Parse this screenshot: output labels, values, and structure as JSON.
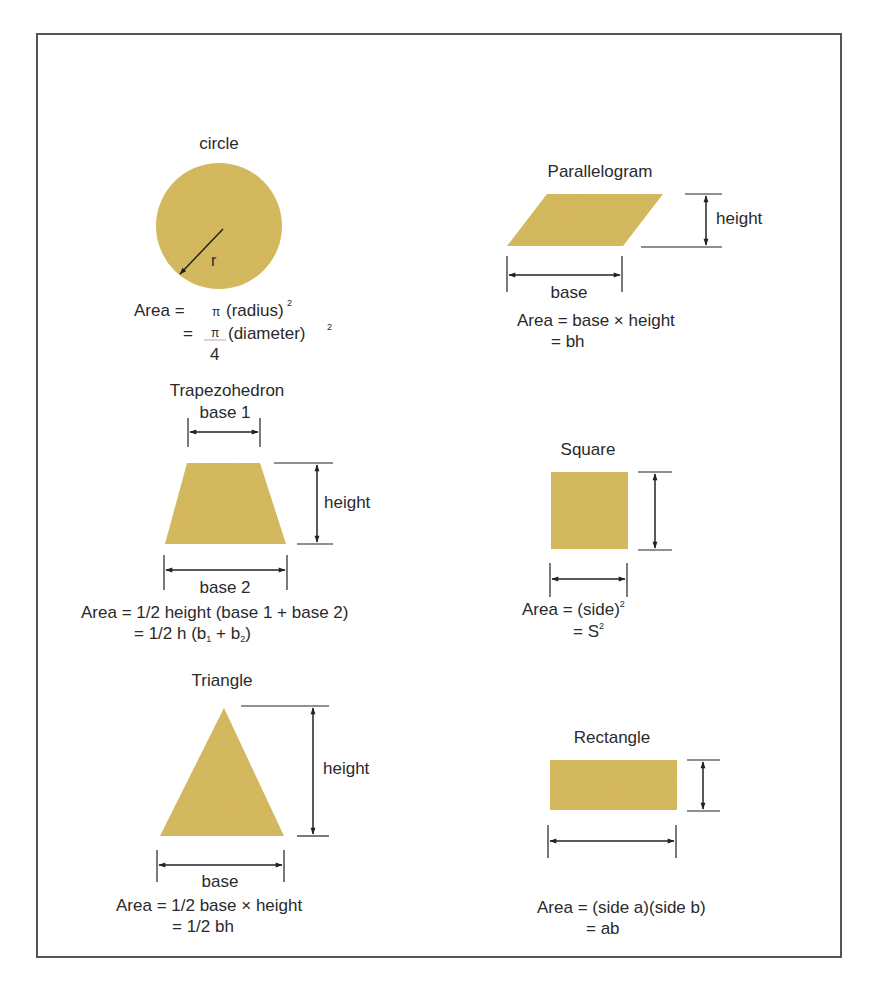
{
  "colors": {
    "shape_fill": "#d9bd62",
    "frame": "#555555",
    "ink": "#2a2a2a"
  },
  "shapes": {
    "circle": {
      "name": "circle",
      "radius_label": "r",
      "formula_line1_prefix": "Area =",
      "formula_line1": "π (radius)",
      "formula_line1_sup": "2",
      "formula_line2_prefix": "=",
      "formula_line2_num": "π",
      "formula_line2_den": "4",
      "formula_line2": "(diameter)",
      "formula_line2_sup": "2"
    },
    "parallelogram": {
      "name": "Parallelogram",
      "height_label": "height",
      "base_label": "base",
      "formula_line1": "Area = base × height",
      "formula_line2": "= bh"
    },
    "trapezoid": {
      "name": "Trapezohedron",
      "base1_label": "base 1",
      "base2_label": "base 2",
      "height_label": "height",
      "formula_line1": "Area = 1/2 height (base 1 + base 2)",
      "formula_line2_a": "= 1/2 h (b",
      "formula_line2_sub1": "1",
      "formula_line2_b": " + b",
      "formula_line2_sub2": "2",
      "formula_line2_c": ")"
    },
    "square": {
      "name": "Square",
      "formula_line1": "Area = (side)",
      "formula_line1_sup": "2",
      "formula_line2": "= S",
      "formula_line2_sup": "2"
    },
    "triangle": {
      "name": "Triangle",
      "height_label": "height",
      "base_label": "base",
      "formula_line1": "Area = 1/2 base × height",
      "formula_line2": "= 1/2 bh"
    },
    "rectangle": {
      "name": "Rectangle",
      "formula_line1": "Area = (side a)(side b)",
      "formula_line2": "= ab"
    }
  }
}
